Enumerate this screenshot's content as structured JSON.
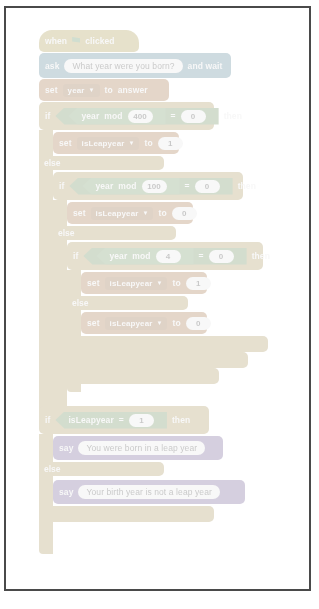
{
  "document": {
    "title": "Scratch leap year script",
    "frame_border_color": "#4a4a4a",
    "background_color": "#ffffff"
  },
  "palette": {
    "events": "#c8a200",
    "sensing": "#2e8eb8",
    "data": "#d96d0b",
    "control": "#c99b1f",
    "looks": "#7b4fc9",
    "operator": "#4f9c2e"
  },
  "script": {
    "hat": {
      "prefix": "when",
      "icon": "green-flag-icon",
      "suffix": "clicked"
    },
    "ask": {
      "label": "ask",
      "question": "What year were you born?",
      "suffix": "and wait"
    },
    "set_year": {
      "label": "set",
      "variable": "year",
      "to": "to",
      "value": "answer"
    },
    "if1": {
      "keyword": "if",
      "then": "then",
      "condition": {
        "left_variable": "year",
        "operator": "mod",
        "right_value": "400",
        "comparator": "=",
        "compare_to": "0"
      },
      "body": {
        "label": "set",
        "variable": "isLeapyear",
        "to": "to",
        "value": "1"
      },
      "else_label": "else"
    },
    "if2": {
      "keyword": "if",
      "then": "then",
      "condition": {
        "left_variable": "year",
        "operator": "mod",
        "right_value": "100",
        "comparator": "=",
        "compare_to": "0"
      },
      "body": {
        "label": "set",
        "variable": "isLeapyear",
        "to": "to",
        "value": "0"
      },
      "else_label": "else"
    },
    "if3": {
      "keyword": "if",
      "then": "then",
      "condition": {
        "left_variable": "year",
        "operator": "mod",
        "right_value": "4",
        "comparator": "=",
        "compare_to": "0"
      },
      "body": {
        "label": "set",
        "variable": "isLeapyear",
        "to": "to",
        "value": "1"
      },
      "else_label": "else",
      "else_body": {
        "label": "set",
        "variable": "isLeapyear",
        "to": "to",
        "value": "0"
      }
    },
    "if4": {
      "keyword": "if",
      "then": "then",
      "condition": {
        "left_variable": "isLeapyear",
        "comparator": "=",
        "compare_to": "1"
      },
      "say_true": {
        "label": "say",
        "text": "You were born in a leap year"
      },
      "else_label": "else",
      "say_false": {
        "label": "say",
        "text": "Your birth year is not a leap year"
      }
    }
  }
}
